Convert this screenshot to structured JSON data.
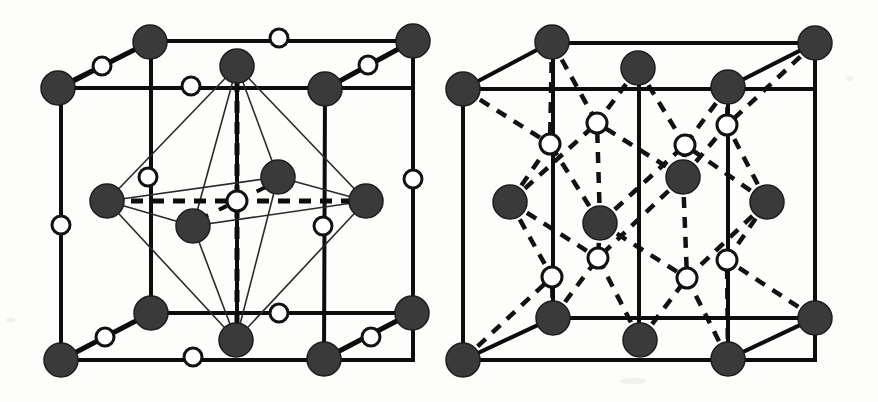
{
  "figure": {
    "background_color": "#fdfdfb",
    "atom_filled_color": "#3a3a3a",
    "atom_open_color": "#ffffff",
    "bond_color": "#0d0d0d",
    "width": 878,
    "height": 402
  },
  "diagrams": [
    {
      "id": "left-cell",
      "name": "left-unit-cell",
      "cube": {
        "front": {
          "left": 61,
          "right": 413,
          "top": 88,
          "bottom": 360
        },
        "back": {
          "left": 151,
          "right": 413,
          "top": 41,
          "bottom": 313
        },
        "back_left_x": 151,
        "back_top_y": 86,
        "mid_x": 237
      },
      "polyhedron": {
        "type": "octahedron",
        "apex_top": [
          237,
          66
        ],
        "apex_bottom": [
          236,
          339
        ],
        "equator": [
          [
            107,
            201
          ],
          [
            278,
            177
          ],
          [
            365,
            201
          ],
          [
            193,
            226
          ]
        ],
        "center": [
          237,
          201
        ]
      },
      "filled_atoms": [
        {
          "cx": 58,
          "cy": 88,
          "r": 17,
          "label": "front-top-left-corner"
        },
        {
          "cx": 150,
          "cy": 42,
          "r": 17,
          "label": "back-top-left-corner"
        },
        {
          "cx": 237,
          "cy": 66,
          "r": 17,
          "label": "octahedron-top-apex"
        },
        {
          "cx": 325,
          "cy": 89,
          "r": 17,
          "label": "front-top-mid-face"
        },
        {
          "cx": 413,
          "cy": 41,
          "r": 17,
          "label": "back-top-right-corner"
        },
        {
          "cx": 107,
          "cy": 201,
          "r": 17,
          "label": "left-equatorial"
        },
        {
          "cx": 278,
          "cy": 177,
          "r": 17,
          "label": "upper-right-equatorial"
        },
        {
          "cx": 193,
          "cy": 226,
          "r": 17,
          "label": "lower-left-equatorial"
        },
        {
          "cx": 366,
          "cy": 201,
          "r": 17,
          "label": "right-equatorial"
        },
        {
          "cx": 61,
          "cy": 360,
          "r": 17,
          "label": "front-bottom-left-corner"
        },
        {
          "cx": 151,
          "cy": 313,
          "r": 17,
          "label": "back-bottom-left-corner"
        },
        {
          "cx": 236,
          "cy": 340,
          "r": 17,
          "label": "octahedron-bottom-apex"
        },
        {
          "cx": 324,
          "cy": 359,
          "r": 17,
          "label": "front-bottom-mid-face"
        },
        {
          "cx": 412,
          "cy": 313,
          "r": 17,
          "label": "back-bottom-right-corner"
        }
      ],
      "open_atoms": [
        {
          "cx": 102,
          "cy": 66,
          "r": 9,
          "label": "top-left-edge-open"
        },
        {
          "cx": 191,
          "cy": 86,
          "r": 9,
          "label": "back-top-left-edge-open"
        },
        {
          "cx": 279,
          "cy": 38,
          "r": 9,
          "label": "back-top-edge-open"
        },
        {
          "cx": 368,
          "cy": 65,
          "r": 9,
          "label": "top-right-edge-open"
        },
        {
          "cx": 148,
          "cy": 177,
          "r": 9,
          "label": "left-vertical-open"
        },
        {
          "cx": 61,
          "cy": 225,
          "r": 9,
          "label": "front-left-edge-open"
        },
        {
          "cx": 237,
          "cy": 201,
          "r": 9,
          "label": "body-centre-open"
        },
        {
          "cx": 323,
          "cy": 226,
          "r": 9,
          "label": "right-inner-open"
        },
        {
          "cx": 413,
          "cy": 179,
          "r": 9,
          "label": "front-right-edge-open"
        },
        {
          "cx": 105,
          "cy": 337,
          "r": 9,
          "label": "bottom-left-edge-open"
        },
        {
          "cx": 193,
          "cy": 357,
          "r": 9,
          "label": "front-bottom-left-open"
        },
        {
          "cx": 279,
          "cy": 313,
          "r": 9,
          "label": "back-bottom-edge-open"
        },
        {
          "cx": 371,
          "cy": 337,
          "r": 9,
          "label": "bottom-right-edge-open"
        }
      ]
    },
    {
      "id": "right-cell",
      "name": "right-unit-cell",
      "cube": {
        "front": {
          "left": 463,
          "right": 815,
          "top": 89,
          "bottom": 360
        },
        "back": {
          "left": 553,
          "right": 815,
          "top": 43,
          "bottom": 318
        },
        "back_left_x": 553,
        "back_top_y": 87,
        "mid_x": 639
      },
      "filled_atoms": [
        {
          "cx": 463,
          "cy": 89,
          "r": 17,
          "label": "front-top-left-corner"
        },
        {
          "cx": 552,
          "cy": 42,
          "r": 17,
          "label": "back-top-left-corner"
        },
        {
          "cx": 638,
          "cy": 68,
          "r": 17,
          "label": "top-face-centre"
        },
        {
          "cx": 728,
          "cy": 87,
          "r": 17,
          "label": "front-top-mid-face"
        },
        {
          "cx": 815,
          "cy": 43,
          "r": 17,
          "label": "back-top-right-corner"
        },
        {
          "cx": 510,
          "cy": 202,
          "r": 17,
          "label": "left-face-centre"
        },
        {
          "cx": 600,
          "cy": 223,
          "r": 17,
          "label": "inner-lower-left"
        },
        {
          "cx": 683,
          "cy": 177,
          "r": 17,
          "label": "inner-upper-right"
        },
        {
          "cx": 767,
          "cy": 202,
          "r": 17,
          "label": "right-face-centre"
        },
        {
          "cx": 463,
          "cy": 360,
          "r": 17,
          "label": "front-bottom-left-corner"
        },
        {
          "cx": 553,
          "cy": 318,
          "r": 17,
          "label": "back-bottom-left-corner"
        },
        {
          "cx": 640,
          "cy": 340,
          "r": 17,
          "label": "bottom-face-centre"
        },
        {
          "cx": 728,
          "cy": 359,
          "r": 17,
          "label": "front-bottom-mid-face"
        },
        {
          "cx": 815,
          "cy": 318,
          "r": 17,
          "label": "back-bottom-right-corner"
        }
      ],
      "open_atoms": [
        {
          "cx": 597,
          "cy": 123,
          "r": 10,
          "label": "tetra-site-top-left"
        },
        {
          "cx": 550,
          "cy": 144,
          "r": 10,
          "label": "tetra-site-left-upper"
        },
        {
          "cx": 685,
          "cy": 145,
          "r": 10,
          "label": "tetra-site-centre-upper"
        },
        {
          "cx": 727,
          "cy": 125,
          "r": 10,
          "label": "tetra-site-top-right"
        },
        {
          "cx": 598,
          "cy": 258,
          "r": 10,
          "label": "tetra-site-bottom-left"
        },
        {
          "cx": 552,
          "cy": 277,
          "r": 10,
          "label": "tetra-site-left-lower"
        },
        {
          "cx": 687,
          "cy": 278,
          "r": 10,
          "label": "tetra-site-centre-lower"
        },
        {
          "cx": 727,
          "cy": 260,
          "r": 10,
          "label": "tetra-site-bottom-right"
        }
      ],
      "dashed_bonds": [
        [
          552,
          42,
          597,
          123
        ],
        [
          552,
          42,
          550,
          144
        ],
        [
          638,
          68,
          597,
          123
        ],
        [
          638,
          68,
          685,
          145
        ],
        [
          728,
          87,
          685,
          145
        ],
        [
          728,
          87,
          727,
          125
        ],
        [
          815,
          43,
          727,
          125
        ],
        [
          463,
          89,
          550,
          144
        ],
        [
          510,
          202,
          550,
          144
        ],
        [
          510,
          202,
          597,
          123
        ],
        [
          510,
          202,
          552,
          277
        ],
        [
          510,
          202,
          598,
          258
        ],
        [
          600,
          223,
          597,
          123
        ],
        [
          600,
          223,
          550,
          144
        ],
        [
          600,
          223,
          685,
          145
        ],
        [
          600,
          223,
          598,
          258
        ],
        [
          600,
          223,
          687,
          278
        ],
        [
          683,
          177,
          685,
          145
        ],
        [
          683,
          177,
          597,
          123
        ],
        [
          683,
          177,
          727,
          125
        ],
        [
          683,
          177,
          687,
          278
        ],
        [
          683,
          177,
          598,
          258
        ],
        [
          767,
          202,
          727,
          125
        ],
        [
          767,
          202,
          685,
          145
        ],
        [
          767,
          202,
          727,
          260
        ],
        [
          767,
          202,
          687,
          278
        ],
        [
          553,
          318,
          552,
          277
        ],
        [
          553,
          318,
          598,
          258
        ],
        [
          640,
          340,
          598,
          258
        ],
        [
          640,
          340,
          687,
          278
        ],
        [
          728,
          359,
          687,
          278
        ],
        [
          728,
          359,
          727,
          260
        ],
        [
          815,
          318,
          727,
          260
        ],
        [
          463,
          360,
          552,
          277
        ]
      ]
    }
  ]
}
